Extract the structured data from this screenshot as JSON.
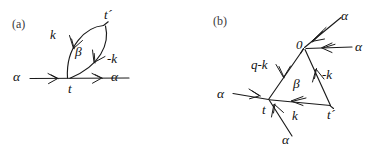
{
  "figure": {
    "type": "feynman-diagram-pair",
    "background_color": "#ffffff",
    "ink_color": "#1a1a1a",
    "panels": [
      {
        "id": "a",
        "panel_label": "(a)",
        "labels": {
          "t_prime": "t´",
          "k": "k",
          "beta": "β",
          "minus_k": "-k",
          "alpha_left": "α",
          "alpha_right": "α",
          "t": "t"
        }
      },
      {
        "id": "b",
        "panel_label": "(b)",
        "labels": {
          "alpha_top": "α",
          "alpha_right": "α",
          "zero": "0",
          "q_minus_k": "q-k",
          "minus_k": "-k",
          "beta": "β",
          "alpha_left": "α",
          "t": "t",
          "k": "k",
          "t_prime": "t´",
          "alpha_bottom": "α"
        }
      }
    ]
  }
}
